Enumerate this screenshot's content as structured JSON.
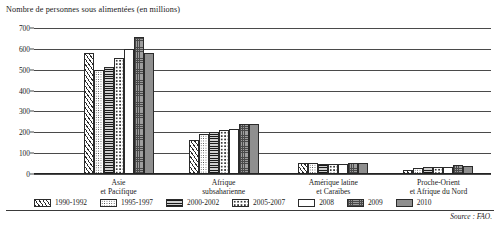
{
  "chart_data": {
    "type": "bar",
    "title": "Nombre de personnes sous alimentées (en millions)",
    "xlabel": "",
    "ylabel": "",
    "ylim": [
      0,
      700
    ],
    "ytick_step": 100,
    "yticks": [
      "0",
      "100",
      "200",
      "300",
      "400",
      "500",
      "600",
      "700"
    ],
    "grid": true,
    "legend_position": "bottom",
    "categories": [
      "Asie\net Pacifique",
      "Afrique\nsubsaharienne",
      "Amérique latine\net Caraïbes",
      "Proche-Orient\net Afrique du Nord"
    ],
    "series": [
      {
        "name": "1990-1992",
        "pattern": "p-diag",
        "values": [
          580,
          165,
          54,
          19
        ]
      },
      {
        "name": "1995-1997",
        "pattern": "p-dots",
        "values": [
          498,
          192,
          53,
          28
        ]
      },
      {
        "name": "2000-2002",
        "pattern": "p-hlines",
        "values": [
          512,
          202,
          50,
          32
        ]
      },
      {
        "name": "2005-2007",
        "pattern": "p-sparse",
        "values": [
          554,
          210,
          47,
          33
        ]
      },
      {
        "name": "2008",
        "pattern": "p-white",
        "values": [
          597,
          218,
          47,
          35
        ]
      },
      {
        "name": "2009",
        "pattern": "p-grid",
        "values": [
          658,
          242,
          53,
          42
        ]
      },
      {
        "name": "2010",
        "pattern": "p-solid",
        "values": [
          578,
          239,
          53,
          37
        ]
      }
    ],
    "source": "Source : FAO."
  },
  "legend": {
    "items": [
      {
        "label": "1990-1992"
      },
      {
        "label": "1995-1997"
      },
      {
        "label": "2000-2002"
      },
      {
        "label": "2005-2007"
      },
      {
        "label": "2008"
      },
      {
        "label": "2009"
      },
      {
        "label": "2010"
      }
    ]
  },
  "footer": {
    "source": "Source : FAO."
  }
}
